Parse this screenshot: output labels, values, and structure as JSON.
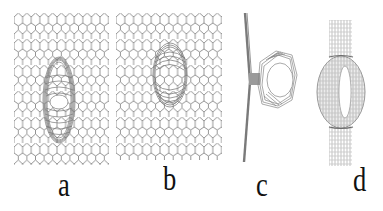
{
  "figure": {
    "panels": [
      {
        "id": "a",
        "label": "a",
        "description": "graphene sheet with elongated toroidal defect (side view, tilted)"
      },
      {
        "id": "b",
        "label": "b",
        "description": "graphene sheet with compact toroidal defect"
      },
      {
        "id": "c",
        "label": "c",
        "description": "edge-on view of sheet with attached ring"
      },
      {
        "id": "d",
        "label": "d",
        "description": "narrow strip with torus ring"
      }
    ],
    "colors": {
      "lattice": "#8a8a8a",
      "torus": "#7a7a7a",
      "label": "#111111",
      "background": "#ffffff"
    }
  }
}
